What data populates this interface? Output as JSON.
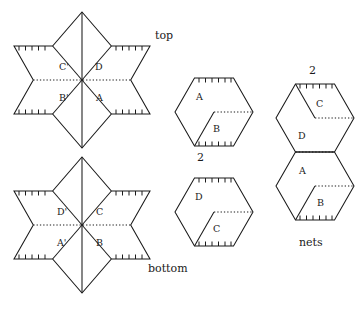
{
  "figure": {
    "stroke_color": "#1a1a1a",
    "background_color": "#ffffff"
  },
  "captions": {
    "top": "top",
    "bottom": "bottom",
    "nets": "nets",
    "hexagon_multiplier": "2",
    "stacked_multiplier": "2"
  },
  "star_top": {
    "name": "top",
    "faces": [
      {
        "id": "c-prime",
        "label": "C'"
      },
      {
        "id": "d",
        "label": "D"
      },
      {
        "id": "b-prime",
        "label": "B'"
      },
      {
        "id": "a",
        "label": "A"
      }
    ]
  },
  "star_bottom": {
    "name": "bottom",
    "faces": [
      {
        "id": "d-prime",
        "label": "D'"
      },
      {
        "id": "c",
        "label": "C"
      },
      {
        "id": "a-prime",
        "label": "A'"
      },
      {
        "id": "b",
        "label": "B"
      }
    ]
  },
  "hexagon_upper": {
    "multiplier": "2",
    "faces": [
      {
        "id": "a",
        "label": "A"
      },
      {
        "id": "b",
        "label": "B"
      }
    ]
  },
  "hexagon_lower": {
    "faces": [
      {
        "id": "d",
        "label": "D"
      },
      {
        "id": "c",
        "label": "C"
      }
    ]
  },
  "stacked_nets": {
    "multiplier": "2",
    "caption": "nets",
    "faces": [
      {
        "id": "c",
        "label": "C"
      },
      {
        "id": "d",
        "label": "D"
      },
      {
        "id": "a",
        "label": "A"
      },
      {
        "id": "b",
        "label": "B"
      }
    ]
  }
}
